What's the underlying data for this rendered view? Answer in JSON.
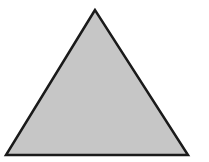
{
  "diagram": {
    "shape": "triangle",
    "fill_color": "#c6c6c6",
    "stroke_color": "#1a1a1a",
    "stroke_width": 2.5,
    "points": {
      "apex": [
        95,
        10
      ],
      "bottom_left": [
        6,
        155
      ],
      "bottom_right": [
        188,
        155
      ]
    }
  }
}
